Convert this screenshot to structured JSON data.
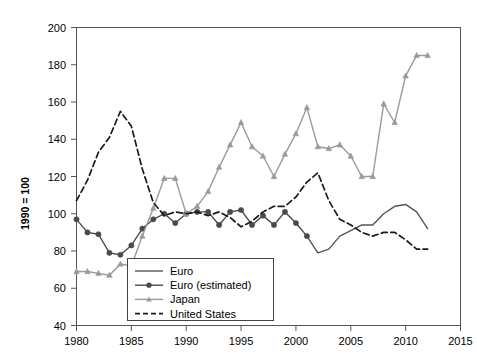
{
  "chart_data": {
    "type": "line",
    "title": "",
    "subtitle": "",
    "xlabel": "",
    "ylabel": "1990 = 100",
    "xlim": [
      1980,
      2015
    ],
    "ylim": [
      40,
      200
    ],
    "xticks": [
      1980,
      1985,
      1990,
      1995,
      2000,
      2005,
      2010,
      2015
    ],
    "yticks": [
      40,
      60,
      80,
      100,
      120,
      140,
      160,
      180,
      200
    ],
    "grid": false,
    "legend_position": "bottom-left-inside",
    "series": [
      {
        "name": "Euro",
        "style": "solid",
        "marker": "none",
        "color": "#555555",
        "x": [
          2001,
          2002,
          2003,
          2004,
          2005,
          2006,
          2007,
          2008,
          2009,
          2010,
          2011,
          2012
        ],
        "values": [
          88,
          79,
          81,
          88,
          91,
          94,
          94,
          100,
          104,
          105,
          101,
          92
        ]
      },
      {
        "name": "Euro (estimated)",
        "style": "solid",
        "marker": "circle",
        "color": "#4a4a4a",
        "x": [
          1980,
          1981,
          1982,
          1983,
          1984,
          1985,
          1986,
          1987,
          1988,
          1989,
          1990,
          1991,
          1992,
          1993,
          1994,
          1995,
          1996,
          1997,
          1998,
          1999,
          2000,
          2001
        ],
        "values": [
          97,
          90,
          89,
          79,
          78,
          83,
          92,
          97,
          100,
          95,
          100,
          101,
          101,
          94,
          101,
          102,
          94,
          99,
          94,
          101,
          95,
          88
        ]
      },
      {
        "name": "Japan",
        "style": "solid",
        "marker": "triangle",
        "color": "#9a9a9a",
        "x": [
          1980,
          1981,
          1982,
          1983,
          1984,
          1985,
          1986,
          1987,
          1988,
          1989,
          1990,
          1991,
          1992,
          1993,
          1994,
          1995,
          1996,
          1997,
          1998,
          1999,
          2000,
          2001,
          2002,
          2003,
          2004,
          2005,
          2006,
          2007,
          2008,
          2009,
          2010,
          2011,
          2012
        ],
        "values": [
          69,
          69,
          68,
          67,
          73,
          72,
          88,
          103,
          119,
          119,
          100,
          104,
          112,
          125,
          137,
          149,
          136,
          131,
          120,
          132,
          143,
          157,
          136,
          135,
          137,
          131,
          120,
          120,
          159,
          149,
          174,
          185,
          185
        ]
      },
      {
        "name": "United States",
        "style": "dashed",
        "marker": "none",
        "color": "#1a1a1a",
        "x": [
          1980,
          1981,
          1982,
          1983,
          1984,
          1985,
          1986,
          1987,
          1988,
          1989,
          1990,
          1991,
          1992,
          1993,
          1994,
          1995,
          1996,
          1997,
          1998,
          1999,
          2000,
          2001,
          2002,
          2003,
          2004,
          2005,
          2006,
          2007,
          2008,
          2009,
          2010,
          2011,
          2012
        ],
        "values": [
          107,
          118,
          133,
          141,
          155,
          147,
          124,
          106,
          99,
          101,
          100,
          101,
          99,
          101,
          98,
          93,
          96,
          101,
          104,
          104,
          109,
          117,
          122,
          107,
          97,
          94,
          90,
          88,
          90,
          90,
          86,
          81,
          81
        ]
      }
    ],
    "legend_entries": [
      "Euro",
      "Euro (estimated)",
      "Japan",
      "United States"
    ]
  },
  "axis": {
    "ylabel": "1990 = 100",
    "ytick_labels": [
      "40",
      "60",
      "80",
      "100",
      "120",
      "140",
      "160",
      "180",
      "200"
    ],
    "xtick_labels": [
      "1980",
      "1985",
      "1990",
      "1995",
      "2000",
      "2005",
      "2010",
      "2015"
    ]
  },
  "colors": {
    "euro": "#555555",
    "euro_estimated": "#4a4a4a",
    "japan": "#9a9a9a",
    "united_states": "#1a1a1a",
    "frame": "#555555",
    "background": "#ffffff"
  }
}
